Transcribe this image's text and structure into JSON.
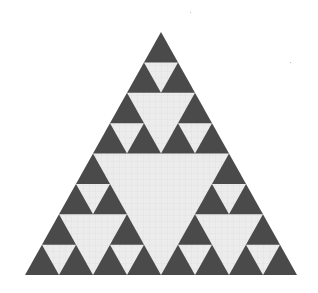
{
  "figure": {
    "type": "sierpinski-triangle",
    "depth": 3,
    "apex": [
      161,
      32
    ],
    "base_left": [
      25,
      275
    ],
    "base_right": [
      297,
      275
    ],
    "colors": {
      "filled": "#4a4a4a",
      "hole": "#ececec",
      "grid": "#d6d6d6",
      "background": "#ffffff"
    }
  }
}
